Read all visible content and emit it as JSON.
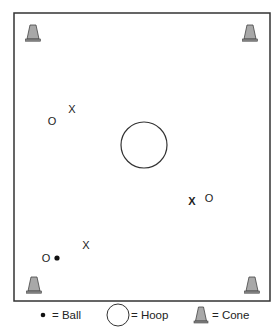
{
  "diagram": {
    "field": {
      "x": 14,
      "y": 13,
      "width": 256,
      "height": 288,
      "stroke": "#333333"
    },
    "cones": [
      {
        "name": "cone-top-left",
        "x": 33,
        "y": 33
      },
      {
        "name": "cone-top-right",
        "x": 250,
        "y": 33
      },
      {
        "name": "cone-bottom-left",
        "x": 34,
        "y": 285
      },
      {
        "name": "cone-bottom-right",
        "x": 252,
        "y": 285
      }
    ],
    "hoop": {
      "cx": 144,
      "cy": 145,
      "r": 23
    },
    "players": [
      {
        "symbol": "O",
        "x": 52,
        "y": 121,
        "team": "offense"
      },
      {
        "symbol": "X",
        "x": 72,
        "y": 109,
        "team": "defense"
      },
      {
        "symbol": "X",
        "x": 192,
        "y": 201,
        "team": "defense",
        "bold": true
      },
      {
        "symbol": "O",
        "x": 209,
        "y": 198,
        "team": "offense"
      },
      {
        "symbol": "X",
        "x": 86,
        "y": 245,
        "team": "defense"
      },
      {
        "symbol": "O",
        "x": 46,
        "y": 258,
        "team": "offense"
      }
    ],
    "balls": [
      {
        "cx": 57,
        "cy": 258,
        "r": 2.5
      }
    ],
    "colors": {
      "cone_fill": "#a8a8a8",
      "cone_stroke": "#444444",
      "line": "#333333"
    }
  },
  "legend": {
    "ball": {
      "label": "= Ball"
    },
    "hoop": {
      "label": "= Hoop"
    },
    "cone": {
      "label": "= Cone"
    }
  }
}
